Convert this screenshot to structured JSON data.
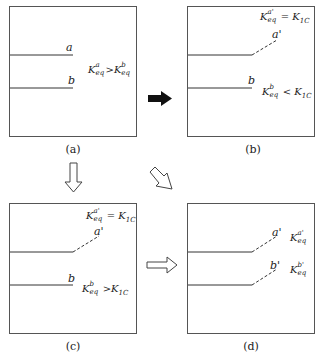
{
  "panels": {
    "a": {
      "caption": "(a)",
      "line_labels": [
        "a",
        "b"
      ],
      "relation": {
        "left": "K",
        "left_sup": "a",
        "left_sub": "eq",
        "op": ">",
        "right": "K",
        "right_sup": "b",
        "right_sub": "eq"
      }
    },
    "b": {
      "caption": "(b)",
      "line_labels": [
        "a'",
        "b"
      ],
      "relation_top": {
        "left": "K",
        "left_sup": "a'",
        "left_sub": "eq",
        "op": "=",
        "right": "K",
        "right_sub": "1C"
      },
      "relation_bottom": {
        "left": "K",
        "left_sup": "b",
        "left_sub": "eq",
        "op": "<",
        "right": "K",
        "right_sub": "1C"
      }
    },
    "c": {
      "caption": "(c)",
      "line_labels": [
        "a'",
        "b"
      ],
      "relation_top": {
        "left": "K",
        "left_sup": "a'",
        "left_sub": "eq",
        "op": "=",
        "right": "K",
        "right_sub": "1C"
      },
      "relation_bottom": {
        "left": "K",
        "left_sup": "b",
        "left_sub": "eq",
        "op": ">",
        "right": "K",
        "right_sub": "1C"
      }
    },
    "d": {
      "caption": "(d)",
      "line_labels": [
        "a'",
        "b'"
      ],
      "k_labels": [
        {
          "left": "K",
          "left_sup": "a'",
          "left_sub": "eq"
        },
        {
          "left": "K",
          "left_sup": "b'",
          "left_sub": "eq"
        }
      ]
    }
  },
  "arrows": [
    {
      "from": "a",
      "to": "b",
      "style": "solid-black"
    },
    {
      "from": "a",
      "to": "c",
      "style": "outline"
    },
    {
      "from": "a",
      "to": "d",
      "style": "outline-diagonal"
    },
    {
      "from": "c",
      "to": "d",
      "style": "outline"
    }
  ]
}
